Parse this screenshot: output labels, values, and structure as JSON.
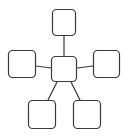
{
  "diagram": {
    "type": "hub-and-spoke",
    "stroke_color": "#3a3a3a",
    "fill_color": "#ffffff",
    "background": "#ffffff",
    "nodes": [
      {
        "id": "center",
        "label": "",
        "x": 51,
        "y": 56,
        "w": 26,
        "h": 26
      },
      {
        "id": "top",
        "label": "",
        "x": 52,
        "y": 9,
        "w": 24,
        "h": 27
      },
      {
        "id": "left",
        "label": "",
        "x": 8,
        "y": 50,
        "w": 28,
        "h": 28
      },
      {
        "id": "right",
        "label": "",
        "x": 93,
        "y": 50,
        "w": 27,
        "h": 28
      },
      {
        "id": "bottom-left",
        "label": "",
        "x": 28,
        "y": 100,
        "w": 28,
        "h": 29
      },
      {
        "id": "bottom-right",
        "label": "",
        "x": 73,
        "y": 100,
        "w": 28,
        "h": 29
      }
    ],
    "edges": [
      {
        "from": "center",
        "to": "top",
        "x1": 64,
        "y1": 56,
        "x2": 64,
        "y2": 36
      },
      {
        "from": "center",
        "to": "left",
        "x1": 51,
        "y1": 68,
        "x2": 36,
        "y2": 66
      },
      {
        "from": "center",
        "to": "right",
        "x1": 77,
        "y1": 68,
        "x2": 93,
        "y2": 66
      },
      {
        "from": "center",
        "to": "bottom-left",
        "x1": 57,
        "y1": 82,
        "x2": 48,
        "y2": 100
      },
      {
        "from": "center",
        "to": "bottom-right",
        "x1": 71,
        "y1": 82,
        "x2": 80,
        "y2": 100
      }
    ]
  }
}
